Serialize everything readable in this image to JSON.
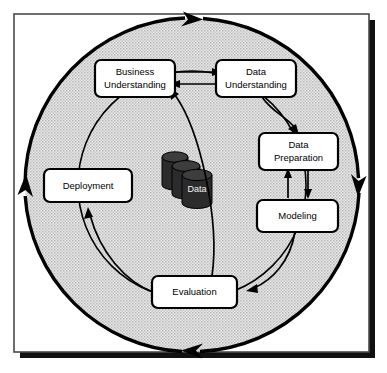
{
  "diagram": {
    "center_icon": {
      "name": "data-cylinder-stack",
      "label": "Data",
      "cylinder_count": 3,
      "fill_color": "#2b2b2b",
      "label_color": "#f2f2f2"
    },
    "ring": {
      "fill_color": "#d6d6d6",
      "stroke_color": "#000000",
      "direction": "clockwise",
      "arrow_positions": [
        "top",
        "right",
        "bottom",
        "left"
      ]
    },
    "frame": {
      "border_color": "#555555",
      "shadow_color": "#000000",
      "background_color": "#ffffff"
    },
    "phases": [
      {
        "id": "business-understanding",
        "label_line1": "Business",
        "label_line2": "Understanding",
        "fill": "#ffffff"
      },
      {
        "id": "data-understanding",
        "label_line1": "Data",
        "label_line2": "Understanding",
        "fill": "#ffffff"
      },
      {
        "id": "data-preparation",
        "label_line1": "Data",
        "label_line2": "Preparation",
        "fill": "#ffffff"
      },
      {
        "id": "modeling",
        "label_line1": "Modeling",
        "label_line2": "",
        "fill": "#ffffff"
      },
      {
        "id": "evaluation",
        "label_line1": "Evaluation",
        "label_line2": "",
        "fill": "#ffffff"
      },
      {
        "id": "deployment",
        "label_line1": "Deployment",
        "label_line2": "",
        "fill": "#ffffff"
      }
    ],
    "connections": [
      {
        "from": "business-understanding",
        "to": "data-understanding",
        "style": "straight",
        "direction": "forward"
      },
      {
        "from": "data-understanding",
        "to": "business-understanding",
        "style": "straight",
        "direction": "backward"
      },
      {
        "from": "data-understanding",
        "to": "data-preparation",
        "style": "curved",
        "direction": "forward"
      },
      {
        "from": "data-preparation",
        "to": "modeling",
        "style": "straight",
        "direction": "forward"
      },
      {
        "from": "modeling",
        "to": "data-preparation",
        "style": "straight",
        "direction": "backward"
      },
      {
        "from": "modeling",
        "to": "evaluation",
        "style": "curved",
        "direction": "forward"
      },
      {
        "from": "evaluation",
        "to": "business-understanding",
        "style": "curved",
        "direction": "backward"
      },
      {
        "from": "evaluation",
        "to": "deployment",
        "style": "curved",
        "direction": "forward"
      }
    ]
  }
}
